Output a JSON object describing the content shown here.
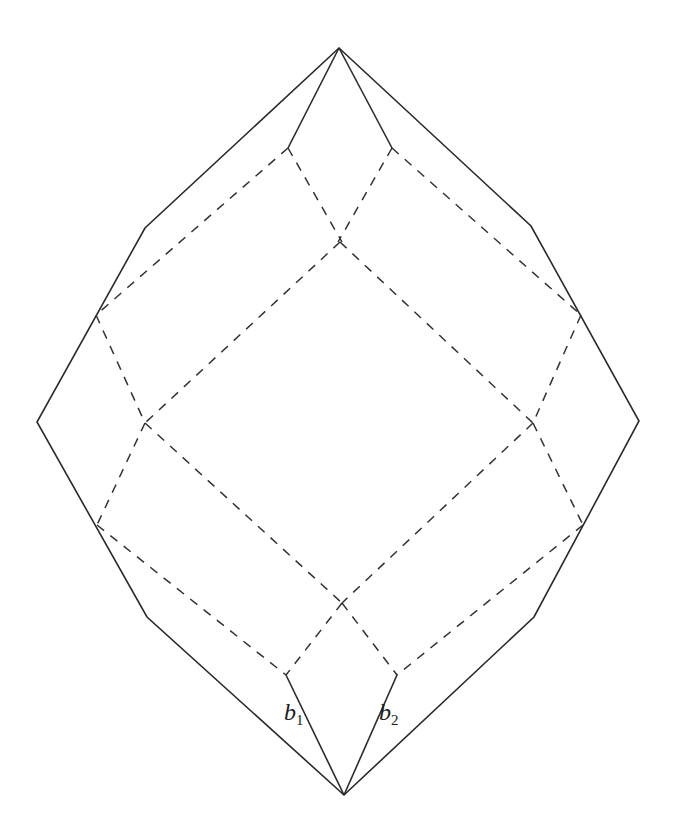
{
  "diagram": {
    "colors": {
      "line": "#2a2a2a",
      "background": "#ffffff"
    },
    "outer_polygon": [
      [
        339,
        48
      ],
      [
        531,
        226
      ],
      [
        639,
        421
      ],
      [
        534,
        617
      ],
      [
        344,
        795
      ],
      [
        147,
        617
      ],
      [
        37,
        422
      ],
      [
        145,
        228
      ]
    ],
    "inner_solid_segments": [
      [
        [
          339,
          48
        ],
        [
          288,
          148
        ]
      ],
      [
        [
          339,
          48
        ],
        [
          392,
          148
        ]
      ],
      [
        [
          344,
          795
        ],
        [
          286,
          675
        ]
      ],
      [
        [
          344,
          795
        ],
        [
          397,
          675
        ]
      ]
    ],
    "dashed_segments": [
      [
        [
          288,
          148
        ],
        [
          96,
          315
        ]
      ],
      [
        [
          392,
          148
        ],
        [
          581,
          315
        ]
      ],
      [
        [
          288,
          148
        ],
        [
          342,
          242
        ]
      ],
      [
        [
          392,
          148
        ],
        [
          338,
          242
        ]
      ],
      [
        [
          340,
          242
        ],
        [
          145,
          423
        ]
      ],
      [
        [
          340,
          242
        ],
        [
          533,
          423
        ]
      ],
      [
        [
          96,
          315
        ],
        [
          145,
          423
        ]
      ],
      [
        [
          581,
          315
        ],
        [
          533,
          423
        ]
      ],
      [
        [
          145,
          423
        ],
        [
          97,
          525
        ]
      ],
      [
        [
          533,
          423
        ],
        [
          583,
          525
        ]
      ],
      [
        [
          145,
          423
        ],
        [
          342,
          603
        ]
      ],
      [
        [
          533,
          423
        ],
        [
          342,
          603
        ]
      ],
      [
        [
          97,
          525
        ],
        [
          286,
          675
        ]
      ],
      [
        [
          583,
          525
        ],
        [
          397,
          675
        ]
      ],
      [
        [
          342,
          603
        ],
        [
          286,
          675
        ]
      ],
      [
        [
          342,
          603
        ],
        [
          397,
          675
        ]
      ]
    ],
    "labels": {
      "b1": {
        "base": "b",
        "sub": "1"
      },
      "b2": {
        "base": "b",
        "sub": "2"
      }
    }
  }
}
